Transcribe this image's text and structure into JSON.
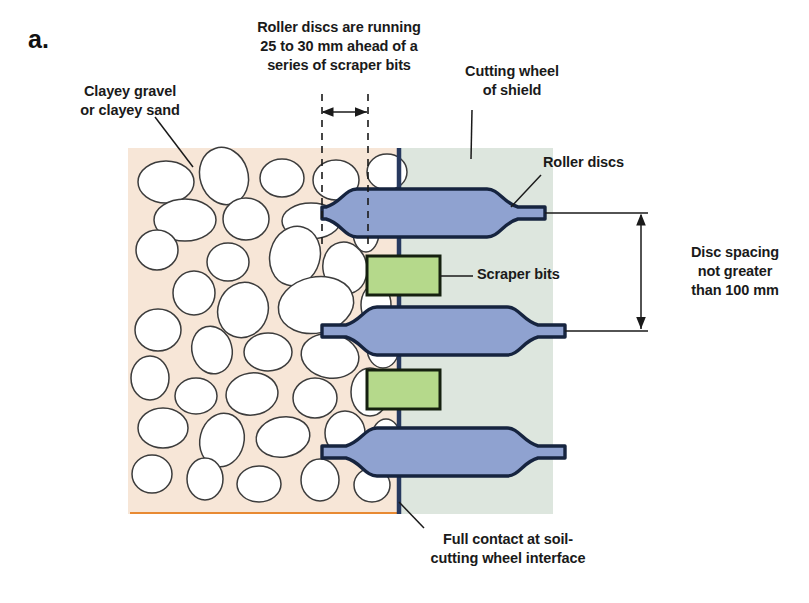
{
  "figure": {
    "panel_label": "a.",
    "type": "engineering-cross-section-diagram"
  },
  "labels": {
    "soil_material": "Clayey gravel\nor clayey sand",
    "roller_lead": "Roller discs are running\n25 to 30 mm ahead of a\nseries of scraper bits",
    "cutting_wheel": "Cutting wheel\nof shield",
    "roller_discs": "Roller discs",
    "disc_spacing": "Disc spacing\nnot greater\nthan 100 mm",
    "scraper_bits": "Scraper bits",
    "full_contact": "Full contact at soil-\ncutting wheel interface"
  },
  "dimensions": {
    "lead_distance": "25 to 30 mm",
    "disc_spacing_max": "100 mm"
  },
  "colors": {
    "soil_fill": "#f7e6d7",
    "wheel_fill": "#dde6de",
    "disc_fill": "#8fa2d0",
    "disc_outline": "#16243f",
    "scraper_fill": "#b5d98b",
    "scraper_outline": "#15200f",
    "spine": "#27395f",
    "soil_baseline": "#e88a33",
    "stroke": "#2a2a2a",
    "page_bg": "#ffffff"
  },
  "components": {
    "discs": [
      {
        "name": "roller-disc-top",
        "center_y": 213
      },
      {
        "name": "roller-disc-middle",
        "center_y": 331
      },
      {
        "name": "roller-disc-bottom",
        "center_y": 452
      }
    ],
    "scrapers": [
      {
        "name": "scraper-bit-upper",
        "center_y": 275
      },
      {
        "name": "scraper-bit-lower",
        "center_y": 389
      }
    ]
  }
}
